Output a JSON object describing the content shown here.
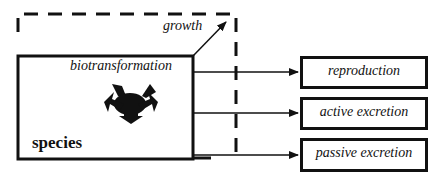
{
  "diagram": {
    "species_label": "species",
    "biotransformation_label": "biotransformation",
    "growth_label": "growth",
    "outputs": [
      {
        "label": "reproduction"
      },
      {
        "label": "active excretion"
      },
      {
        "label": "passive excretion"
      }
    ],
    "colors": {
      "ink": "#111111",
      "background": "#ffffff"
    }
  }
}
